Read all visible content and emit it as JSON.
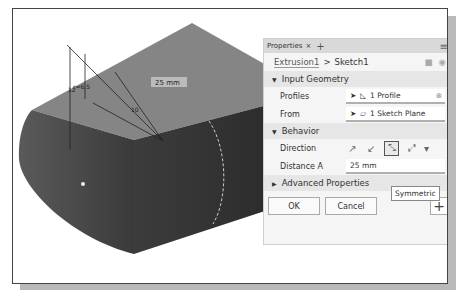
{
  "panel": {
    "tab_label": "Properties",
    "tab_close": "×",
    "tab_add": "+",
    "menu_icon": "≡",
    "breadcrumb": {
      "parent": "Extrusion1",
      "separator": ">",
      "current": "Sketch1"
    },
    "sections": {
      "input_geometry": {
        "title": "Input Geometry",
        "rows": [
          {
            "label": "Profiles",
            "value": "1 Profile"
          },
          {
            "label": "From",
            "value": "1 Sketch Plane"
          }
        ]
      },
      "behavior": {
        "title": "Behavior",
        "direction_label": "Direction",
        "distance_label": "Distance A",
        "distance_value": "25 mm",
        "tooltip": "Symmetric"
      },
      "advanced": {
        "title": "Advanced Properties"
      }
    },
    "buttons": {
      "ok": "OK",
      "cancel": "Cancel",
      "add": "+"
    }
  },
  "viewport": {
    "dimension_label": "25 mm",
    "dim_10": "10",
    "dim_12": "12",
    "dim_r": "r=6.5"
  }
}
